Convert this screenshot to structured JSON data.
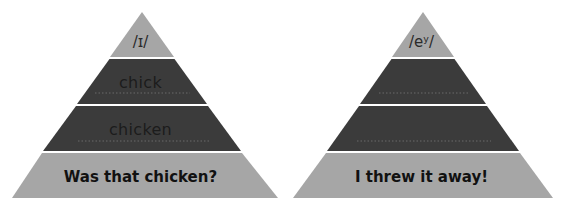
{
  "colors": {
    "light_tier": "#a6a6a6",
    "dark_tier": "#3b3b3b",
    "separator": "#ffffff",
    "dotted_line": "#6a6a6a",
    "background": "#ffffff"
  },
  "pyramids": [
    {
      "tiers": [
        {
          "label": "/ɪ/",
          "shade": "light"
        },
        {
          "label": "chick",
          "shade": "dark",
          "write_line": true
        },
        {
          "label": "chicken",
          "shade": "dark",
          "write_line": true
        },
        {
          "label": "Was that chicken?",
          "shade": "light"
        }
      ]
    },
    {
      "tiers": [
        {
          "label": "/eʸ/",
          "shade": "light"
        },
        {
          "label": "",
          "shade": "dark",
          "write_line": true
        },
        {
          "label": "",
          "shade": "dark",
          "write_line": true
        },
        {
          "label": "I threw it away!",
          "shade": "light"
        }
      ]
    }
  ]
}
